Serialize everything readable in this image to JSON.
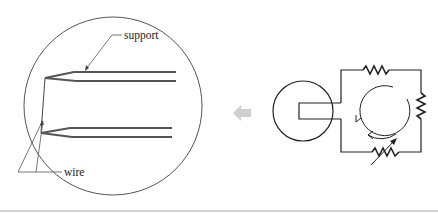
{
  "diagram": {
    "title": "",
    "magnified_view": {
      "labels": {
        "support": "support",
        "wire": "wire"
      }
    },
    "direction_arrow": {
      "direction": "left",
      "color": "#cfcfcf"
    },
    "circuit": {
      "components": [
        "resistor-top",
        "resistor-right",
        "variable-resistor-bottom"
      ],
      "current_direction": "counterclockwise"
    },
    "colors": {
      "line": "#333333",
      "support": "#555555",
      "arrow": "#cfcfcf",
      "rule": "#d4d4d4"
    }
  }
}
